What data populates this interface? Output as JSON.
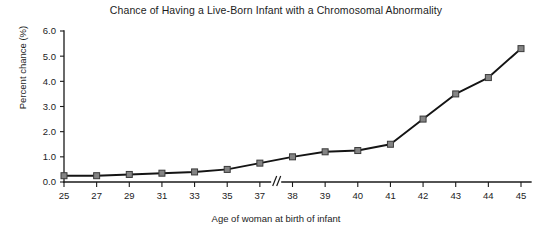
{
  "chart_data": {
    "type": "line",
    "title": "Chance of Having a Live-Born Infant with a Chromosomal Abnormality",
    "xlabel": "Age of woman at birth of infant",
    "ylabel": "Percent chance (%)",
    "categories": [
      "25",
      "27",
      "29",
      "31",
      "33",
      "35",
      "37",
      "38",
      "39",
      "40",
      "41",
      "42",
      "43",
      "44",
      "45"
    ],
    "values": [
      0.25,
      0.25,
      0.3,
      0.35,
      0.4,
      0.5,
      0.75,
      1.0,
      1.2,
      1.25,
      1.5,
      2.5,
      3.5,
      4.15,
      5.3
    ],
    "series": [
      {
        "name": "Percent chance",
        "values": [
          0.25,
          0.25,
          0.3,
          0.35,
          0.4,
          0.5,
          0.75,
          1.0,
          1.2,
          1.25,
          1.5,
          2.5,
          3.5,
          4.15,
          5.3
        ]
      }
    ],
    "ylim": [
      0.0,
      6.0
    ],
    "ytick_labels": [
      "0.0",
      "1.0",
      "2.0",
      "3.0",
      "4.0",
      "5.0",
      "6.0"
    ],
    "ytick_values": [
      0.0,
      1.0,
      2.0,
      3.0,
      4.0,
      5.0,
      6.0
    ],
    "xtick_labels": [
      "25",
      "27",
      "29",
      "31",
      "33",
      "35",
      "37",
      "38",
      "39",
      "40",
      "41",
      "42",
      "43",
      "44",
      "45"
    ],
    "grid": false,
    "legend": false,
    "legend_position": "none",
    "axis_break": {
      "present": true,
      "between": [
        "37",
        "38"
      ],
      "symbol": "//"
    },
    "marker": "square",
    "marker_color": "#848484",
    "line_color": "#141414",
    "background_color": "#ffffff"
  }
}
